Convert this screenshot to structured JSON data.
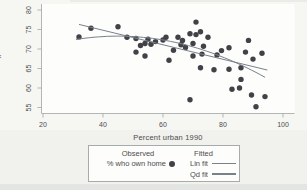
{
  "figure": {
    "y_axis_cropped_label": "x"
  },
  "colors": {
    "point": "#414147",
    "fit_line": "#78828b",
    "axis": "#a9afae",
    "tick_text": "#4d4d4d",
    "plot_bg": "#fdfdfc"
  },
  "chart_data": {
    "type": "scatter",
    "title": "",
    "xlabel": "Percent urban 1990",
    "ylabel": "% who own home",
    "xlim": [
      20,
      100
    ],
    "ylim": [
      55,
      80
    ],
    "x_ticks": [
      20,
      40,
      60,
      80,
      100
    ],
    "y_ticks": [
      55,
      60,
      65,
      70,
      75,
      80
    ],
    "grid": false,
    "series": [
      {
        "name": "% who own home",
        "type": "scatter",
        "points": [
          [
            32,
            73.1
          ],
          [
            36,
            75.3
          ],
          [
            45,
            75.7
          ],
          [
            48,
            73.0
          ],
          [
            51,
            72.7
          ],
          [
            51,
            69.2
          ],
          [
            52.5,
            70.9
          ],
          [
            54,
            71.4
          ],
          [
            54,
            68.2
          ],
          [
            55,
            72.5
          ],
          [
            56,
            71.2
          ],
          [
            57.5,
            71.9
          ],
          [
            60,
            72.3
          ],
          [
            61,
            73.0
          ],
          [
            62,
            67.1
          ],
          [
            63.5,
            69.7
          ],
          [
            65,
            73.0
          ],
          [
            66.5,
            72.2
          ],
          [
            66,
            71.1
          ],
          [
            67.5,
            70.4
          ],
          [
            69,
            73.9
          ],
          [
            69,
            57.0
          ],
          [
            70,
            71.4
          ],
          [
            70,
            68.2
          ],
          [
            71,
            76.9
          ],
          [
            71,
            73.7
          ],
          [
            72.5,
            74.4
          ],
          [
            72.5,
            65.2
          ],
          [
            73.5,
            70.7
          ],
          [
            73,
            68.7
          ],
          [
            75,
            73.0
          ],
          [
            77,
            64.7
          ],
          [
            78,
            68.5
          ],
          [
            79.5,
            69.6
          ],
          [
            82,
            70.3
          ],
          [
            82,
            64.8
          ],
          [
            83,
            59.7
          ],
          [
            85.5,
            60.0
          ],
          [
            86,
            62.2
          ],
          [
            86,
            65.2
          ],
          [
            87.5,
            69.2
          ],
          [
            88.5,
            72.2
          ],
          [
            90,
            67.4
          ],
          [
            89.5,
            58.2
          ],
          [
            91,
            55.2
          ],
          [
            93,
            68.9
          ],
          [
            94,
            57.8
          ]
        ]
      },
      {
        "name": "Lin fit",
        "type": "line",
        "points": [
          [
            32,
            76.3
          ],
          [
            94.8,
            64.6
          ]
        ]
      },
      {
        "name": "Qd fit",
        "type": "quadratic",
        "vertex": [
          45,
          73.3
        ],
        "coeff": -0.0044,
        "x_range": [
          31,
          94.8
        ]
      }
    ],
    "legend": {
      "position": "bottom",
      "columns": [
        {
          "header": "Observed",
          "entries": [
            {
              "label": "% who own home",
              "marker": "dot"
            }
          ]
        },
        {
          "header": "Fitted",
          "entries": [
            {
              "label": "Lin fit",
              "marker": "line"
            },
            {
              "label": "Qd fit",
              "marker": "line"
            }
          ]
        }
      ]
    }
  }
}
